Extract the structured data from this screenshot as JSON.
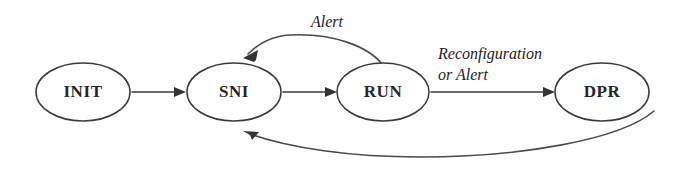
{
  "diagram": {
    "type": "state-transition-diagram",
    "background_color": "#ffffff",
    "stroke_color": "#3a3a3a",
    "text_color": "#262626",
    "nodes": [
      {
        "id": "init",
        "label": "INIT",
        "cx": 83,
        "cy": 92,
        "rx": 47,
        "ry": 29
      },
      {
        "id": "sni",
        "label": "SNI",
        "cx": 234,
        "cy": 92,
        "rx": 47,
        "ry": 29
      },
      {
        "id": "run",
        "label": "RUN",
        "cx": 383,
        "cy": 92,
        "rx": 46,
        "ry": 29
      },
      {
        "id": "dpr",
        "label": "DPR",
        "cx": 602,
        "cy": 92,
        "rx": 47,
        "ry": 29
      }
    ],
    "edges": [
      {
        "id": "init-to-sni",
        "from": "INIT",
        "to": "SNI",
        "label": "",
        "shape": "straight"
      },
      {
        "id": "sni-to-run",
        "from": "SNI",
        "to": "RUN",
        "label": "",
        "shape": "straight"
      },
      {
        "id": "run-to-dpr",
        "from": "RUN",
        "to": "DPR",
        "label": "Reconfiguration or Alert",
        "shape": "straight"
      },
      {
        "id": "run-to-sni",
        "from": "RUN",
        "to": "SNI",
        "label": "Alert",
        "shape": "curved-above"
      },
      {
        "id": "dpr-to-sni",
        "from": "DPR",
        "to": "SNI",
        "label": "",
        "shape": "curved-below"
      }
    ],
    "labels": {
      "alert": "Alert",
      "reconfiguration_line1": "Reconfiguration",
      "reconfiguration_line2": "or Alert"
    }
  }
}
